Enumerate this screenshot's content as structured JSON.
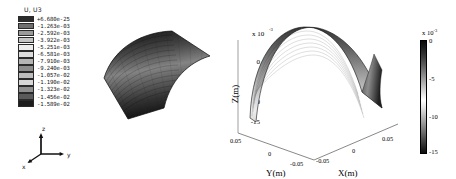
{
  "figure": {
    "type": "two-panel-3d-surface-comparison",
    "background": "#ffffff"
  },
  "left_panel": {
    "legend_title": "U, U3",
    "legend_values": [
      "+6.680e-25",
      "-1.263e-03",
      "-2.592e-03",
      "-3.922e-03",
      "-5.251e-03",
      "-6.581e-03",
      "-7.910e-03",
      "-9.240e-03",
      "-1.057e-02",
      "-1.190e-02",
      "-1.323e-02",
      "-1.456e-02",
      "-1.589e-02"
    ],
    "legend_colors": [
      "#2b2b2b",
      "#6e6e6e",
      "#9a9a9a",
      "#c4c4c4",
      "#ececec",
      "#dcdcdc",
      "#b4b4b4",
      "#8c8c8c",
      "#bdbdbd",
      "#d6d6d6",
      "#8f8f8f",
      "#5a5a5a",
      "#1d1d1d"
    ],
    "triad": {
      "z_label": "z",
      "y_label": "y",
      "x_label": "x"
    },
    "surface_description": "dark contoured arch shell"
  },
  "right_panel": {
    "z_axis_label": "Z(m)",
    "y_axis_label": "Y(m)",
    "x_axis_label": "X(m)",
    "z_exponent": "x 10",
    "z_exponent_sup": "-3",
    "z_ticks": [
      "0",
      "-5",
      "-10",
      "-15"
    ],
    "y_ticks": [
      "0.05",
      "0",
      "-0.05"
    ],
    "x_ticks": [
      "-0.05",
      "0",
      "0.05"
    ],
    "colorbar": {
      "exponent": "x 10",
      "exponent_sup": "-3",
      "ticks": [
        "0",
        "-5",
        "-10",
        "-15"
      ]
    }
  },
  "chart_data": {
    "type": "surface",
    "title": "",
    "panels": [
      {
        "name": "abaqus-contour-plot",
        "type": "surface",
        "legend_title": "U, U3",
        "colormap": "grayscale-banded",
        "contour_levels": [
          6.68e-25,
          -0.001263,
          -0.002592,
          -0.003922,
          -0.005251,
          -0.006581,
          -0.00791,
          -0.00924,
          -0.01057,
          -0.0119,
          -0.01323,
          -0.01456,
          -0.01589
        ],
        "value_min": -0.01589,
        "value_max": 6.68e-25,
        "units": "m",
        "quantity": "vertical displacement U3"
      },
      {
        "name": "matlab-surface-plot",
        "type": "surface",
        "xlabel": "X(m)",
        "ylabel": "Y(m)",
        "zlabel": "Z(m)",
        "xlim": [
          -0.075,
          0.075
        ],
        "ylim": [
          -0.075,
          0.075
        ],
        "zlim": [
          -0.016,
          0.0
        ],
        "xticks": [
          -0.05,
          0,
          0.05
        ],
        "yticks": [
          0.05,
          0,
          -0.05
        ],
        "zticks": [
          0,
          -5,
          -10,
          -15
        ],
        "z_scale_exponent": -3,
        "colorbar_ticks": [
          0,
          -5,
          -10,
          -15
        ],
        "colorbar_exponent": -3,
        "grid": false,
        "colormap": "grayscale"
      }
    ]
  }
}
